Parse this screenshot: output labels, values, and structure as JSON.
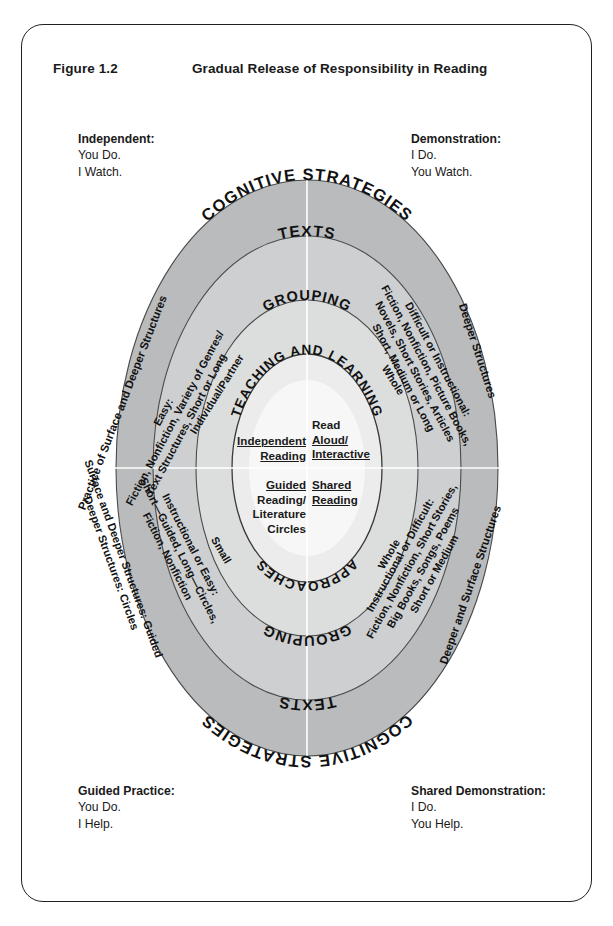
{
  "figure": {
    "number": "Figure 1.2",
    "title": "Gradual Release of Responsibility in Reading"
  },
  "corners": {
    "top_left": {
      "title": "Independent:",
      "line1": "You Do.",
      "line2": "I Watch."
    },
    "top_right": {
      "title": "Demonstration:",
      "line1": "I Do.",
      "line2": "You Watch."
    },
    "bottom_left": {
      "title": "Guided Practice:",
      "line1": "You Do.",
      "line2": "I Help."
    },
    "bottom_right": {
      "title": "Shared Demonstration:",
      "line1": "I Do.",
      "line2": "You Help."
    }
  },
  "rings": {
    "outer": {
      "name": "cognitive-strategies-ring",
      "top_label": "COGNITIVE STRATEGIES",
      "bottom_label": "COGNITIVE STRATEGIES",
      "color": "#b9bbbd"
    },
    "texts": {
      "name": "texts-ring",
      "top_label": "TEXTS",
      "bottom_label": "TEXTS",
      "color": "#cdcfd1"
    },
    "grouping": {
      "name": "grouping-ring",
      "top_label": "GROUPING",
      "bottom_label": "GROUPING",
      "color": "#dcdede"
    },
    "core": {
      "name": "teaching-and-learning-core",
      "top_label": "TEACHING AND LEARNING",
      "bottom_label": "APPROACHES",
      "color": "#eceded"
    },
    "center": {
      "name": "center-ellipse",
      "color": "#f7f7f7"
    }
  },
  "quadrant_text": {
    "outer_ring": {
      "upper_left": "Practice of Surface and Deeper Structures",
      "upper_right": "Deeper Structures",
      "lower_left": "Surface and Deeper Structures; Guided Deeper Structures: Circles",
      "lower_right": "Deeper and Surface Structures"
    },
    "texts_ring": {
      "upper_left_line1": "Easy:",
      "upper_left_line2": "Fiction, Nonfiction, Variety of Genres/",
      "upper_left_line3": "Text Structures, Short or Long",
      "upper_right_line1": "Difficult or Instructional:",
      "upper_right_line2": "Fiction, Nonfiction, Picture Books,",
      "upper_right_line3": "Novels, Short Stories, Articles",
      "upper_right_line4": "Short, Medium or Long",
      "lower_left_line1": "Instructional or Easy:",
      "lower_left_line2": "Short—Guided, Long—Circles,",
      "lower_left_line3": "Fiction, Nonfiction",
      "lower_right_line1": "Instructional or Difficult:",
      "lower_right_line2": "Fiction, Nonfiction, Short Stories,",
      "lower_right_line3": "Big Books, Songs, Poems",
      "lower_right_line4": "Short or Medium"
    },
    "grouping_ring": {
      "upper_left": "Individual/Partner",
      "upper_right": "Whole",
      "lower_left": "Small",
      "lower_right": "Whole"
    }
  },
  "center_quadrants": {
    "top_left": "Independent Reading",
    "top_left_line1": "Independent",
    "top_left_line2": "Reading",
    "top_right_line1": "Read",
    "top_right_line2": "Aloud/",
    "top_right_line3": "Interactive",
    "bottom_left_line1": "Guided",
    "bottom_left_line2": "Reading/",
    "bottom_left_line3": "Literature",
    "bottom_left_line4": "Circles",
    "bottom_right_line1": "Shared",
    "bottom_right_line2": "Reading"
  }
}
